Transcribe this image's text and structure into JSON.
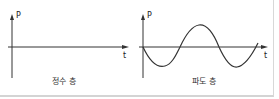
{
  "diagram": {
    "panels": [
      {
        "id": "still-water",
        "caption": "정수 층",
        "y_axis_label": "P",
        "x_axis_label": "t",
        "curve": "flat"
      },
      {
        "id": "wave",
        "caption": "파도 층",
        "y_axis_label": "P",
        "x_axis_label": "t",
        "curve": "sine"
      }
    ],
    "colors": {
      "line": "#333333",
      "border": "#d4d4d4"
    }
  }
}
